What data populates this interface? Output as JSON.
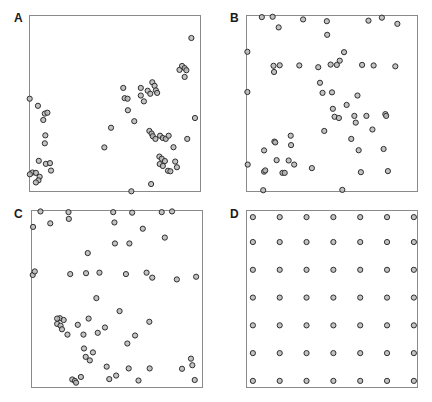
{
  "figure": {
    "width": 432,
    "height": 402,
    "background": "#ffffff",
    "marker": {
      "shape": "open-circle",
      "radius": 2.6,
      "fill": "#b8b8b8",
      "stroke": "#2e2e2e",
      "stroke_width": 1
    },
    "frame_color": "#8a8a8a",
    "label_color": "#1a1a1a"
  },
  "panels": [
    {
      "id": "A",
      "label": "A",
      "label_x": 14,
      "label_y": 12,
      "frame_x": 29,
      "frame_y": 15,
      "frame_w": 172,
      "frame_h": 177
    },
    {
      "id": "B",
      "label": "B",
      "label_x": 230,
      "label_y": 12,
      "frame_x": 246,
      "frame_y": 15,
      "frame_w": 172,
      "frame_h": 177
    },
    {
      "id": "C",
      "label": "C",
      "label_x": 14,
      "label_y": 208,
      "frame_x": 31,
      "frame_y": 210,
      "frame_w": 172,
      "frame_h": 178
    },
    {
      "id": "D",
      "label": "D",
      "label_x": 230,
      "label_y": 208,
      "frame_x": 246,
      "frame_y": 210,
      "frame_w": 172,
      "frame_h": 178
    }
  ],
  "chart_data": {
    "type": "scatter",
    "title": "",
    "xlabel": "",
    "ylabel": "",
    "grid": false,
    "legend": null,
    "axis_ticks": false,
    "panels": [
      {
        "id": "A",
        "label": "A",
        "pattern": "clustered",
        "n_points": 60,
        "xlim": [
          0,
          1
        ],
        "ylim": [
          0,
          1
        ],
        "points": [
          [
            0.004,
            0.527
          ],
          [
            0.052,
            0.487
          ],
          [
            0.092,
            0.443
          ],
          [
            0.107,
            0.448
          ],
          [
            0.083,
            0.407
          ],
          [
            0.095,
            0.32
          ],
          [
            0.092,
            0.275
          ],
          [
            0.057,
            0.176
          ],
          [
            0.098,
            0.159
          ],
          [
            0.122,
            0.163
          ],
          [
            0.02,
            0.11
          ],
          [
            0.04,
            0.108
          ],
          [
            0.062,
            0.086
          ],
          [
            0.055,
            0.066
          ],
          [
            0.04,
            0.054
          ],
          [
            0.128,
            0.121
          ],
          [
            0.005,
            0.1
          ],
          [
            0.438,
            0.252
          ],
          [
            0.477,
            0.363
          ],
          [
            0.548,
            0.588
          ],
          [
            0.556,
            0.53
          ],
          [
            0.573,
            0.527
          ],
          [
            0.575,
            0.462
          ],
          [
            0.612,
            0.4
          ],
          [
            0.65,
            0.588
          ],
          [
            0.65,
            0.545
          ],
          [
            0.668,
            0.512
          ],
          [
            0.69,
            0.572
          ],
          [
            0.705,
            0.555
          ],
          [
            0.717,
            0.62
          ],
          [
            0.73,
            0.6
          ],
          [
            0.738,
            0.574
          ],
          [
            0.745,
            0.56
          ],
          [
            0.7,
            0.345
          ],
          [
            0.713,
            0.33
          ],
          [
            0.72,
            0.315
          ],
          [
            0.735,
            0.3
          ],
          [
            0.762,
            0.318
          ],
          [
            0.778,
            0.305
          ],
          [
            0.795,
            0.3
          ],
          [
            0.812,
            0.318
          ],
          [
            0.758,
            0.2
          ],
          [
            0.772,
            0.188
          ],
          [
            0.79,
            0.175
          ],
          [
            0.76,
            0.158
          ],
          [
            0.778,
            0.147
          ],
          [
            0.808,
            0.12
          ],
          [
            0.822,
            0.117
          ],
          [
            0.84,
            0.253
          ],
          [
            0.85,
            0.172
          ],
          [
            0.86,
            0.14
          ],
          [
            0.875,
            0.69
          ],
          [
            0.89,
            0.712
          ],
          [
            0.905,
            0.7
          ],
          [
            0.915,
            0.688
          ],
          [
            0.905,
            0.65
          ],
          [
            0.92,
            0.3
          ],
          [
            0.944,
            0.87
          ],
          [
            0.965,
            0.418
          ],
          [
            0.71,
            0.045
          ],
          [
            0.595,
            0.004
          ]
        ]
      },
      {
        "id": "B",
        "label": "B",
        "pattern": "random (Poisson)",
        "n_points": 60,
        "xlim": [
          0,
          1
        ],
        "ylim": [
          0,
          1
        ],
        "points": [
          [
            0.008,
            0.792
          ],
          [
            0.008,
            0.565
          ],
          [
            0.01,
            0.155
          ],
          [
            0.092,
            0.988
          ],
          [
            0.1,
            0.01
          ],
          [
            0.105,
            0.235
          ],
          [
            0.105,
            0.115
          ],
          [
            0.112,
            0.122
          ],
          [
            0.155,
            0.99
          ],
          [
            0.16,
            0.713
          ],
          [
            0.163,
            0.678
          ],
          [
            0.165,
            0.285
          ],
          [
            0.17,
            0.28
          ],
          [
            0.178,
            0.18
          ],
          [
            0.19,
            0.93
          ],
          [
            0.196,
            0.716
          ],
          [
            0.212,
            0.108
          ],
          [
            0.225,
            0.108
          ],
          [
            0.248,
            0.178
          ],
          [
            0.26,
            0.318
          ],
          [
            0.262,
            0.265
          ],
          [
            0.28,
            0.155
          ],
          [
            0.31,
            0.715
          ],
          [
            0.332,
            0.975
          ],
          [
            0.383,
            0.135
          ],
          [
            0.42,
            0.705
          ],
          [
            0.43,
            0.617
          ],
          [
            0.445,
            0.56
          ],
          [
            0.455,
            0.345
          ],
          [
            0.47,
            0.965
          ],
          [
            0.472,
            0.888
          ],
          [
            0.492,
            0.72
          ],
          [
            0.5,
            0.563
          ],
          [
            0.505,
            0.47
          ],
          [
            0.515,
            0.425
          ],
          [
            0.528,
            0.718
          ],
          [
            0.54,
            0.418
          ],
          [
            0.545,
            0.742
          ],
          [
            0.56,
            0.012
          ],
          [
            0.57,
            0.79
          ],
          [
            0.585,
            0.492
          ],
          [
            0.612,
            0.3
          ],
          [
            0.63,
            0.43
          ],
          [
            0.638,
            0.392
          ],
          [
            0.648,
            0.545
          ],
          [
            0.655,
            0.236
          ],
          [
            0.668,
            0.112
          ],
          [
            0.675,
            0.718
          ],
          [
            0.7,
            0.43
          ],
          [
            0.712,
            0.968
          ],
          [
            0.735,
            0.353
          ],
          [
            0.742,
            0.715
          ],
          [
            0.79,
            0.985
          ],
          [
            0.8,
            0.243
          ],
          [
            0.81,
            0.44
          ],
          [
            0.815,
            0.43
          ],
          [
            0.825,
            0.118
          ],
          [
            0.868,
            0.71
          ],
          [
            0.88,
            0.95
          ]
        ]
      },
      {
        "id": "C",
        "label": "C",
        "pattern": "random (Poisson)",
        "n_points": 60,
        "xlim": [
          0,
          1
        ],
        "ylim": [
          0,
          1
        ],
        "points": [
          [
            0.012,
            0.905
          ],
          [
            0.01,
            0.635
          ],
          [
            0.022,
            0.655
          ],
          [
            0.055,
            0.992
          ],
          [
            0.112,
            0.925
          ],
          [
            0.152,
            0.36
          ],
          [
            0.168,
            0.392
          ],
          [
            0.172,
            0.35
          ],
          [
            0.18,
            0.33
          ],
          [
            0.19,
            0.382
          ],
          [
            0.218,
            0.988
          ],
          [
            0.22,
            0.95
          ],
          [
            0.228,
            0.64
          ],
          [
            0.24,
            0.048
          ],
          [
            0.255,
            0.04
          ],
          [
            0.262,
            0.03
          ],
          [
            0.272,
            0.355
          ],
          [
            0.29,
            0.062
          ],
          [
            0.305,
            0.3
          ],
          [
            0.308,
            0.222
          ],
          [
            0.318,
            0.175
          ],
          [
            0.32,
            0.645
          ],
          [
            0.33,
            0.758
          ],
          [
            0.335,
            0.39
          ],
          [
            0.342,
            0.155
          ],
          [
            0.36,
            0.2
          ],
          [
            0.38,
            0.505
          ],
          [
            0.388,
            0.31
          ],
          [
            0.398,
            0.648
          ],
          [
            0.43,
            0.34
          ],
          [
            0.44,
            0.12
          ],
          [
            0.455,
            0.05
          ],
          [
            0.478,
            0.988
          ],
          [
            0.485,
            0.93
          ],
          [
            0.488,
            0.812
          ],
          [
            0.495,
            0.07
          ],
          [
            0.515,
            0.432
          ],
          [
            0.552,
            0.64
          ],
          [
            0.56,
            0.25
          ],
          [
            0.568,
            0.11
          ],
          [
            0.572,
            0.812
          ],
          [
            0.588,
            0.985
          ],
          [
            0.605,
            0.295
          ],
          [
            0.625,
            0.042
          ],
          [
            0.65,
            0.895
          ],
          [
            0.672,
            0.648
          ],
          [
            0.688,
            0.372
          ],
          [
            0.69,
            0.11
          ],
          [
            0.705,
            0.62
          ],
          [
            0.76,
            0.988
          ],
          [
            0.778,
            0.845
          ],
          [
            0.82,
            0.992
          ],
          [
            0.848,
            0.61
          ],
          [
            0.878,
            0.108
          ],
          [
            0.93,
            0.165
          ],
          [
            0.938,
            0.128
          ],
          [
            0.952,
            0.045
          ],
          [
            0.96,
            0.625
          ],
          [
            0.152,
            0.39
          ],
          [
            0.212,
            0.3
          ]
        ]
      },
      {
        "id": "D",
        "label": "D",
        "pattern": "regular lattice",
        "n_points": 49,
        "rows": 7,
        "cols": 7,
        "xlim": [
          0,
          1
        ],
        "ylim": [
          0,
          1
        ],
        "x_positions": [
          0.04,
          0.196,
          0.352,
          0.508,
          0.664,
          0.82,
          0.976
        ],
        "y_positions": [
          0.04,
          0.196,
          0.352,
          0.508,
          0.664,
          0.82,
          0.96
        ]
      }
    ]
  }
}
